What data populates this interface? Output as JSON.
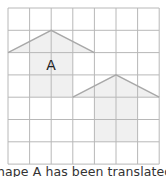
{
  "grid": {
    "columns": 7,
    "rows": 7,
    "left": 8,
    "top": 8,
    "cell_width": 21.6,
    "cell_height": 22.3,
    "line_color": "#b8b8b8",
    "background": "#ffffff"
  },
  "shapes": [
    {
      "name": "shape-a",
      "label": "A",
      "roof": [
        [
          0,
          2
        ],
        [
          2,
          1
        ],
        [
          4,
          2
        ]
      ],
      "body": {
        "col": 1,
        "row": 2,
        "width": 2,
        "height": 2
      },
      "fill": "#f0f0f0",
      "stroke": "#a8a8a8"
    },
    {
      "name": "shape-a-translated",
      "label": "",
      "roof": [
        [
          3,
          4
        ],
        [
          5,
          3
        ],
        [
          7,
          4
        ]
      ],
      "body": {
        "col": 4,
        "row": 4,
        "width": 2,
        "height": 2
      },
      "fill": "#f0f0f0",
      "stroke": "#a8a8a8"
    }
  ],
  "caption": "hape A has been translated 3 squa"
}
